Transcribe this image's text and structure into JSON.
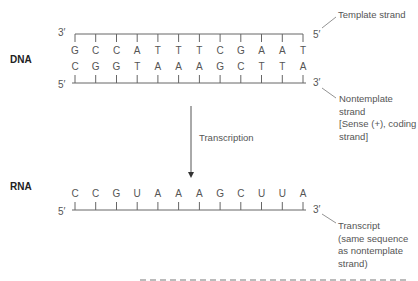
{
  "dna": {
    "label": "DNA",
    "template_strand": {
      "left_end": "3′",
      "right_end": "5′",
      "bases": [
        "G",
        "C",
        "C",
        "A",
        "T",
        "T",
        "T",
        "C",
        "G",
        "A",
        "A",
        "T"
      ],
      "callout": "Template strand"
    },
    "nontemplate_strand": {
      "left_end": "5′",
      "right_end": "3′",
      "bases": [
        "C",
        "G",
        "G",
        "T",
        "A",
        "A",
        "A",
        "G",
        "C",
        "T",
        "T",
        "A"
      ],
      "callout_lines": [
        "Nontemplate",
        "strand",
        "[Sense (+), coding",
        "strand]"
      ]
    }
  },
  "process": {
    "label": "Transcription"
  },
  "rna": {
    "label": "RNA",
    "strand": {
      "left_end": "5′",
      "right_end": "3′",
      "bases": [
        "C",
        "C",
        "G",
        "U",
        "A",
        "A",
        "A",
        "G",
        "C",
        "U",
        "U",
        "A"
      ],
      "callout_lines": [
        "Transcript",
        "(same sequence",
        "as nontemplate",
        "strand)"
      ]
    }
  },
  "colors": {
    "line": "#666666",
    "text": "#555555",
    "label": "#222222"
  }
}
